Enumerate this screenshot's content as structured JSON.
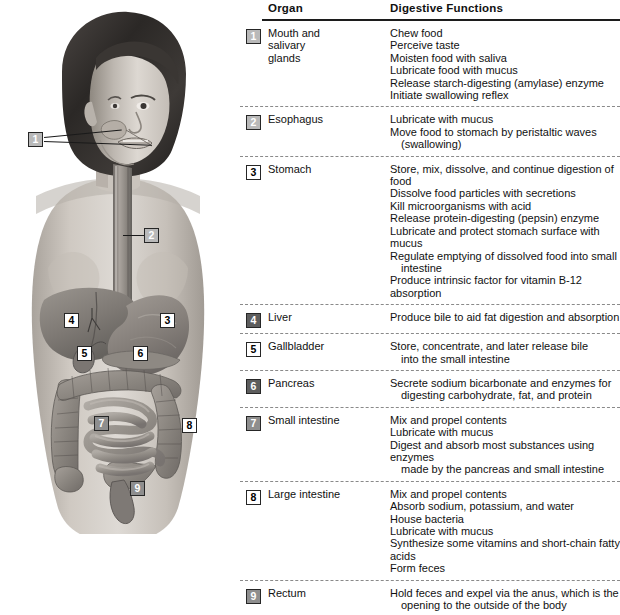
{
  "figure": {
    "illustration_alt": "grayscale anatomical drawing of a woman showing digestive organs"
  },
  "table": {
    "headers": {
      "organ": "Organ",
      "functions": "Digestive Functions"
    },
    "rows": [
      {
        "number": "1",
        "badge_style": "m-lgray",
        "organ": "Mouth and\nsalivary\nglands",
        "functions": [
          {
            "text": "Chew food",
            "indent": false
          },
          {
            "text": "Perceive taste",
            "indent": false
          },
          {
            "text": "Moisten food with saliva",
            "indent": false
          },
          {
            "text": "Lubricate food with mucus",
            "indent": false
          },
          {
            "text": "Release starch-digesting (amylase) enzyme",
            "indent": false
          },
          {
            "text": "Initiate swallowing reflex",
            "indent": false
          }
        ]
      },
      {
        "number": "2",
        "badge_style": "m-lgray",
        "organ": "Esophagus",
        "functions": [
          {
            "text": "Lubricate with mucus",
            "indent": false
          },
          {
            "text": "Move food to stomach by peristaltic waves",
            "indent": false
          },
          {
            "text": "(swallowing)",
            "indent": true
          }
        ]
      },
      {
        "number": "3",
        "badge_style": "m-white",
        "organ": "Stomach",
        "functions": [
          {
            "text": "Store, mix, dissolve, and continue digestion of food",
            "indent": false
          },
          {
            "text": "Dissolve food particles with secretions",
            "indent": false
          },
          {
            "text": "Kill microorganisms with acid",
            "indent": false
          },
          {
            "text": "Release protein-digesting (pepsin) enzyme",
            "indent": false
          },
          {
            "text": "Lubricate and protect stomach surface with mucus",
            "indent": false
          },
          {
            "text": "Regulate emptying of dissolved food into small",
            "indent": false
          },
          {
            "text": "intestine",
            "indent": true
          },
          {
            "text": "Produce intrinsic factor for vitamin B-12 absorption",
            "indent": false
          }
        ]
      },
      {
        "number": "4",
        "badge_style": "m-dgray",
        "organ": "Liver",
        "functions": [
          {
            "text": "Produce bile to aid fat digestion and absorption",
            "indent": false
          }
        ]
      },
      {
        "number": "5",
        "badge_style": "m-white",
        "organ": "Gallbladder",
        "functions": [
          {
            "text": "Store, concentrate, and later release bile",
            "indent": false
          },
          {
            "text": "into the small intestine",
            "indent": true
          }
        ]
      },
      {
        "number": "6",
        "badge_style": "m-dgray",
        "organ": "Pancreas",
        "functions": [
          {
            "text": "Secrete sodium bicarbonate and enzymes for",
            "indent": false
          },
          {
            "text": "digesting carbohydrate, fat, and protein",
            "indent": true
          }
        ]
      },
      {
        "number": "7",
        "badge_style": "m-mgray",
        "organ": "Small intestine",
        "functions": [
          {
            "text": "Mix and propel contents",
            "indent": false
          },
          {
            "text": "Lubricate with mucus",
            "indent": false
          },
          {
            "text": "Digest and absorb most substances using enzymes",
            "indent": false
          },
          {
            "text": "made by the pancreas and small intestine",
            "indent": true
          }
        ]
      },
      {
        "number": "8",
        "badge_style": "m-white",
        "organ": "Large intestine",
        "functions": [
          {
            "text": "Mix and propel contents",
            "indent": false
          },
          {
            "text": "Absorb sodium, potassium, and water",
            "indent": false
          },
          {
            "text": "House bacteria",
            "indent": false
          },
          {
            "text": "Lubricate with mucus",
            "indent": false
          },
          {
            "text": "Synthesize some vitamins and short-chain fatty acids",
            "indent": false
          },
          {
            "text": "Form feces",
            "indent": false
          }
        ]
      },
      {
        "number": "9",
        "badge_style": "m-mgray",
        "organ": "Rectum",
        "functions": [
          {
            "text": "Hold feces and expel via the anus, which is the",
            "indent": false
          },
          {
            "text": "opening to the outside of the body",
            "indent": true
          }
        ]
      }
    ]
  },
  "illustration_markers": [
    {
      "number": "1",
      "badge_style": "m-lgray",
      "x": 28,
      "y": 132,
      "organ": "mouth-and-salivary-glands"
    },
    {
      "number": "2",
      "badge_style": "m-lgray",
      "x": 144,
      "y": 228,
      "organ": "esophagus"
    },
    {
      "number": "3",
      "badge_style": "m-white",
      "x": 160,
      "y": 313,
      "organ": "stomach"
    },
    {
      "number": "4",
      "badge_style": "m-white",
      "x": 64,
      "y": 313,
      "organ": "liver"
    },
    {
      "number": "5",
      "badge_style": "m-white",
      "x": 77,
      "y": 346,
      "organ": "gallbladder"
    },
    {
      "number": "6",
      "badge_style": "m-white",
      "x": 133,
      "y": 346,
      "organ": "pancreas"
    },
    {
      "number": "7",
      "badge_style": "m-mgray",
      "x": 94,
      "y": 416,
      "organ": "small-intestine"
    },
    {
      "number": "8",
      "badge_style": "m-white",
      "x": 182,
      "y": 418,
      "organ": "large-intestine"
    },
    {
      "number": "9",
      "badge_style": "m-mgray",
      "x": 130,
      "y": 481,
      "organ": "rectum"
    }
  ],
  "colors": {
    "rule": "#1c1c1c",
    "separator": "#8a8a8a",
    "text": "#111111",
    "skin_light": "#d8d4cf",
    "skin_mid": "#b4aea7",
    "organ_mid": "#8d8d8d",
    "organ_dark": "#6a6a6a",
    "hair_dark": "#2e2b29"
  }
}
